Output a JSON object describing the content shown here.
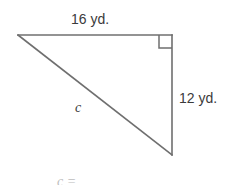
{
  "figure": {
    "background_color": "#ffffff",
    "stroke_color": "#6f6f6f",
    "text_color": "#3b3b3b",
    "stroke_width": 1.6,
    "labels": {
      "top_side": "16 yd.",
      "right_side": "12 yd.",
      "hypotenuse": "c",
      "clipped_answer": "c ="
    },
    "geometry": {
      "left_vertex": [
        18,
        35
      ],
      "top_right_vertex": [
        172,
        35
      ],
      "bottom_right_vertex": [
        172,
        155
      ],
      "right_angle_marker": {
        "x": 159,
        "y": 35,
        "size": 13,
        "at_vertex": "top_right_vertex"
      }
    },
    "measurements": {
      "leg_a": 16,
      "leg_b": 12,
      "unit": "yd.",
      "hypotenuse_variable": "c"
    }
  }
}
